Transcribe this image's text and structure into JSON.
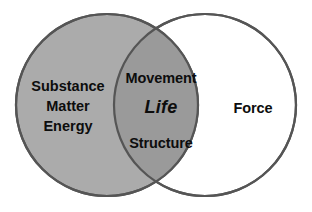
{
  "diagram": {
    "type": "venn-2-circle",
    "background_color": "#ffffff",
    "stroke_color": "#555555",
    "left_circle": {
      "name": "substance-circle",
      "fill_color": "#ababab",
      "cx": 107,
      "cy": 105,
      "r": 91,
      "labels": [
        "Substance",
        "Matter",
        "Energy"
      ]
    },
    "right_circle": {
      "name": "force-circle",
      "fill_color": "#ffffff",
      "cx": 205,
      "cy": 105,
      "r": 91,
      "labels": [
        "Force"
      ]
    },
    "intersection": {
      "name": "life-intersection",
      "fill_color": "#9a9a9a",
      "labels": {
        "top": "Movement",
        "center": "Life",
        "bottom": "Structure"
      }
    }
  }
}
